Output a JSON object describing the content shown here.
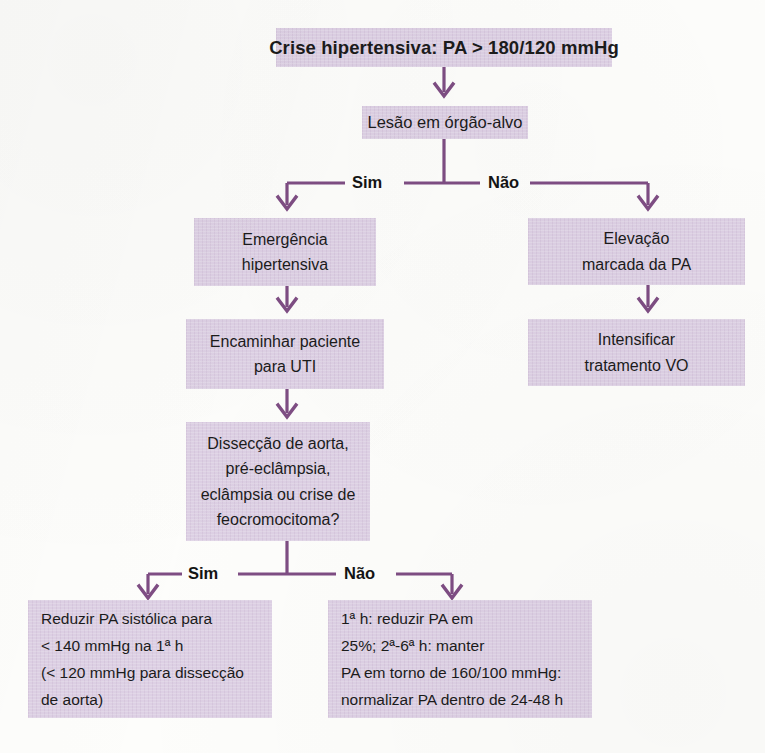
{
  "diagram": {
    "title_box": {
      "text": "Crise hipertensiva: PA > 180/120 mmHg"
    },
    "assessment_box": {
      "text": "Lesão em órgão-alvo"
    },
    "branch_labels": {
      "top_yes": "Sim",
      "top_no": "Não",
      "bottom_yes": "Sim",
      "bottom_no": "Não"
    },
    "emergency_box": {
      "line1": "Emergência",
      "line2": "hipertensiva"
    },
    "icu_box": {
      "line1": "Encaminhar paciente",
      "line2": "para UTI"
    },
    "elevation_box": {
      "line1": "Elevação",
      "line2": "marcada da PA"
    },
    "intensify_box": {
      "line1": "Intensificar",
      "line2": "tratamento VO"
    },
    "decision_box": {
      "line1": "Dissecção de aorta,",
      "line2": "pré-eclâmpsia,",
      "line3": "eclâmpsia ou crise de",
      "line4": "feocromocitoma?"
    },
    "outcome_left_box": {
      "line1": "Reduzir PA sistólica para",
      "line2": "< 140 mmHg na 1ª h",
      "line3": "(< 120 mmHg para dissecção",
      "line4": "de aorta)"
    },
    "outcome_right_box": {
      "line1": "1ª h: reduzir PA em",
      "line2": "25%; 2ª-6ª h: manter",
      "line3": "PA em torno de 160/100 mmHg:",
      "line4": "normalizar PA dentro de 24-48 h"
    },
    "colors": {
      "box_fill": "#ddd0e4",
      "connector": "#7e4d83",
      "text": "#1b1b1b",
      "paper": "#fdfdfb"
    }
  }
}
